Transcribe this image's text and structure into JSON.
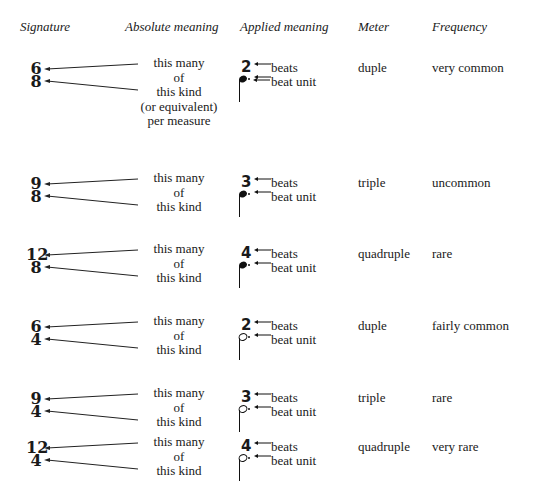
{
  "headers": {
    "signature": "Signature",
    "absolute": "Absolute meaning",
    "applied": "Applied meaning",
    "meter": "Meter",
    "frequency": "Frequency"
  },
  "labels": {
    "this_many": "this many",
    "of": "of",
    "this_kind": "this kind",
    "or_equivalent": "(or equivalent)",
    "per_measure": "per measure",
    "beats": "beats",
    "beat_unit": "beat unit"
  },
  "rows": [
    {
      "top": "6",
      "bottom": "8",
      "beats": "2",
      "beat_unit_note": "dotted quarter",
      "meter": "duple",
      "frequency": "very common"
    },
    {
      "top": "9",
      "bottom": "8",
      "beats": "3",
      "beat_unit_note": "dotted quarter",
      "meter": "triple",
      "frequency": "uncommon"
    },
    {
      "top": "12",
      "bottom": "8",
      "beats": "4",
      "beat_unit_note": "dotted quarter",
      "meter": "quadruple",
      "frequency": "rare"
    },
    {
      "top": "6",
      "bottom": "4",
      "beats": "2",
      "beat_unit_note": "dotted half",
      "meter": "duple",
      "frequency": "fairly common"
    },
    {
      "top": "9",
      "bottom": "4",
      "beats": "3",
      "beat_unit_note": "dotted half",
      "meter": "triple",
      "frequency": "rare"
    },
    {
      "top": "12",
      "bottom": "4",
      "beats": "4",
      "beat_unit_note": "dotted half",
      "meter": "quadruple",
      "frequency": "very rare"
    }
  ]
}
